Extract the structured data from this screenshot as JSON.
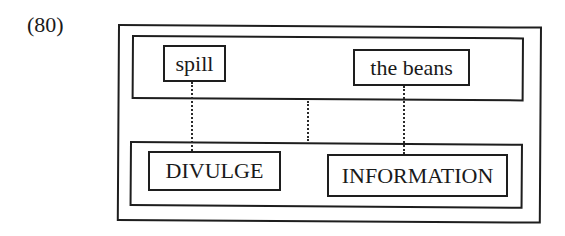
{
  "example": {
    "number_label": "(80)"
  },
  "diagram": {
    "top_layer": {
      "items": [
        {
          "label": "spill"
        },
        {
          "label": "the beans"
        }
      ]
    },
    "bottom_layer": {
      "items": [
        {
          "label": "DIVULGE"
        },
        {
          "label": "INFORMATION"
        }
      ]
    },
    "connectors": [
      {
        "from": "spill",
        "to": "DIVULGE",
        "style": "dotted"
      },
      {
        "from": "top-layer",
        "to": "bottom-layer",
        "style": "dotted"
      },
      {
        "from": "the beans",
        "to": "INFORMATION",
        "style": "dotted"
      }
    ],
    "colors": {
      "line": "#1e1e1e",
      "background": "#ffffff"
    }
  }
}
